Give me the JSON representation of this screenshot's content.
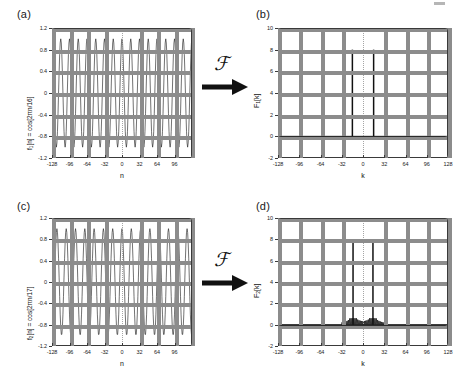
{
  "figure": {
    "panels": [
      {
        "id": "a",
        "label": "(a)",
        "ylabel": "f1[n] = cos[2πn/16]",
        "xlabel": "n"
      },
      {
        "id": "b",
        "label": "(b)",
        "ylabel": "F1[k]",
        "xlabel": "k"
      },
      {
        "id": "c",
        "label": "(c)",
        "ylabel": "f2[n] = cos[2πn/17]",
        "xlabel": "n"
      },
      {
        "id": "d",
        "label": "(d)",
        "ylabel": "F2[k]",
        "xlabel": "k"
      }
    ],
    "operators": [
      {
        "symbol": "ℱ",
        "name": "fourier-transform-operator-top"
      },
      {
        "symbol": "ℱ",
        "name": "fourier-transform-operator-bottom"
      }
    ],
    "colors": {
      "axis": "#3a3a3a",
      "grid": "#9a9a9a",
      "trace": "#1a1a1a",
      "background": "#ffffff"
    }
  },
  "chart_data": [
    {
      "type": "line",
      "panel": "a",
      "title": "(a)",
      "xlabel": "n",
      "ylabel": "f1[n] = cos[2πn/16]",
      "xlim": [
        -128,
        128
      ],
      "ylim": [
        -1.2,
        1.2
      ],
      "xticks": [
        -128,
        -96,
        -64,
        -32,
        0,
        32,
        64,
        96
      ],
      "yticks": [
        -1.2,
        -0.8,
        -0.4,
        0,
        0.4,
        0.8,
        1.2
      ],
      "grid": true,
      "legend": "none",
      "description": "Discrete cosine sequence of period 16 samples sampled over n = -128..127; amplitude 1.0, dense oscillation showing 16 full cycles across the window.",
      "function": "cos(2*pi*n/16)",
      "period": 16,
      "amplitude": 1.0,
      "n_start": -128,
      "n_end": 127,
      "cycles_in_window": 16
    },
    {
      "type": "line",
      "panel": "b",
      "title": "(b)",
      "xlabel": "k",
      "ylabel": "F1[k]",
      "xlim": [
        -128,
        128
      ],
      "ylim": [
        -2,
        10
      ],
      "xticks": [
        -128,
        -96,
        -64,
        -32,
        0,
        32,
        64,
        96,
        128
      ],
      "yticks": [
        -2,
        0,
        2,
        4,
        6,
        8,
        10
      ],
      "grid": true,
      "legend": "none",
      "description": "DFT magnitude of f1[n]: two clean spectral lines of height 8 at k = -16 and k = +16, zero elsewhere. No spectral leakage because the period divides the window length exactly.",
      "spikes": [
        {
          "k": -16,
          "value": 8
        },
        {
          "k": 16,
          "value": 8
        }
      ],
      "baseline": 0,
      "leakage": false
    },
    {
      "type": "line",
      "panel": "c",
      "title": "(c)",
      "xlabel": "n",
      "ylabel": "f2[n] = cos[2πn/17]",
      "xlim": [
        -128,
        128
      ],
      "ylim": [
        -1.2,
        1.2
      ],
      "xticks": [
        -128,
        -96,
        -64,
        -32,
        0,
        32,
        64,
        96
      ],
      "yticks": [
        -1.2,
        -0.8,
        -0.4,
        0,
        0.4,
        0.8,
        1.2
      ],
      "grid": true,
      "legend": "none",
      "description": "Discrete cosine sequence of period 17 samples sampled over n = -128..127; amplitude 1.0, non-integer number of cycles in the window.",
      "function": "cos(2*pi*n/17)",
      "period": 17,
      "amplitude": 1.0,
      "n_start": -128,
      "n_end": 127,
      "cycles_in_window": 15.06
    },
    {
      "type": "line",
      "panel": "d",
      "title": "(d)",
      "xlabel": "k",
      "ylabel": "F2[k]",
      "xlim": [
        -128,
        128
      ],
      "ylim": [
        -2,
        10
      ],
      "xticks": [
        -128,
        -96,
        -64,
        -32,
        0,
        32,
        64,
        96,
        128
      ],
      "yticks": [
        -2,
        0,
        2,
        4,
        6,
        8,
        10
      ],
      "grid": true,
      "legend": "none",
      "description": "DFT magnitude of f2[n]: two main lines of height 8 near k = -15 and k = +15 accompanied by low-amplitude spectral leakage sidelobes spreading along the baseline between roughly k = -32 and k = +32.",
      "spikes": [
        {
          "k": -15,
          "value": 8
        },
        {
          "k": 15,
          "value": 8
        }
      ],
      "baseline": 0,
      "leakage": true,
      "leakage_range": [
        -32,
        32
      ],
      "leakage_peak": 0.6
    }
  ]
}
